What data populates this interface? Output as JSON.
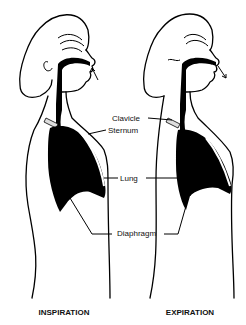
{
  "figure": {
    "panels": [
      {
        "id": "inspiration",
        "caption": "INSPIRATION",
        "airflow": "in"
      },
      {
        "id": "expiration",
        "caption": "EXPIRATION",
        "airflow": "out"
      }
    ],
    "labels": {
      "clavicle": "Clavicle",
      "sternum": "Sternum",
      "lung": "Lung",
      "diaphragm": "Diaphragm"
    }
  }
}
